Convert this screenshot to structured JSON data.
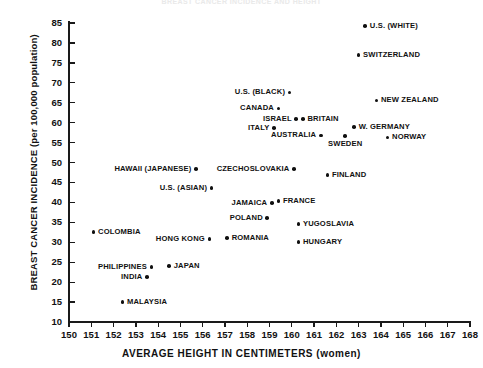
{
  "chart_data": {
    "type": "scatter",
    "title": "BREAST CANCER INCIDENCE AND HEIGHT",
    "xlabel": "AVERAGE HEIGHT IN CENTIMETERS (women)",
    "ylabel": "BREAST CANCER INCIDENCE (per 100,000 population)",
    "xlim": [
      150,
      168
    ],
    "ylim": [
      10,
      85
    ],
    "xticks": [
      150,
      151,
      152,
      153,
      154,
      155,
      156,
      157,
      158,
      159,
      160,
      161,
      162,
      163,
      164,
      165,
      166,
      167,
      168
    ],
    "yticks": [
      10,
      15,
      20,
      25,
      30,
      35,
      40,
      45,
      50,
      55,
      60,
      65,
      70,
      75,
      80,
      85
    ],
    "grid": false,
    "legend": false,
    "marker": "filled-circle",
    "points": [
      {
        "label": "U.S. (WHITE)",
        "x": 163.3,
        "y": 84.2,
        "label_pos": "right"
      },
      {
        "label": "SWITZERLAND",
        "x": 163.0,
        "y": 77.0,
        "label_pos": "right"
      },
      {
        "label": "U.S. (BLACK)",
        "x": 159.9,
        "y": 67.6,
        "label_pos": "left"
      },
      {
        "label": "NEW ZEALAND",
        "x": 163.8,
        "y": 65.6,
        "label_pos": "right"
      },
      {
        "label": "CANADA",
        "x": 159.4,
        "y": 63.6,
        "label_pos": "left"
      },
      {
        "label": "ISRAEL",
        "x": 160.2,
        "y": 60.9,
        "label_pos": "left"
      },
      {
        "label": "BRITAIN",
        "x": 160.5,
        "y": 60.9,
        "label_pos": "right"
      },
      {
        "label": "W. GERMANY",
        "x": 162.8,
        "y": 58.9,
        "label_pos": "right"
      },
      {
        "label": "ITALY",
        "x": 159.2,
        "y": 58.6,
        "label_pos": "left"
      },
      {
        "label": "AUSTRALIA",
        "x": 161.3,
        "y": 56.8,
        "label_pos": "left"
      },
      {
        "label": "SWEDEN",
        "x": 162.4,
        "y": 56.6,
        "label_pos": "below"
      },
      {
        "label": "NORWAY",
        "x": 164.3,
        "y": 56.3,
        "label_pos": "right"
      },
      {
        "label": "HAWAII (JAPANESE)",
        "x": 155.7,
        "y": 48.4,
        "label_pos": "left"
      },
      {
        "label": "CZECHOSLOVAKIA",
        "x": 160.1,
        "y": 48.4,
        "label_pos": "left"
      },
      {
        "label": "FINLAND",
        "x": 161.6,
        "y": 46.9,
        "label_pos": "right"
      },
      {
        "label": "U.S. (ASIAN)",
        "x": 156.4,
        "y": 43.6,
        "label_pos": "left"
      },
      {
        "label": "FRANCE",
        "x": 159.4,
        "y": 40.3,
        "label_pos": "right"
      },
      {
        "label": "JAMAICA",
        "x": 159.1,
        "y": 39.8,
        "label_pos": "left"
      },
      {
        "label": "POLAND",
        "x": 158.9,
        "y": 36.1,
        "label_pos": "left"
      },
      {
        "label": "YUGOSLAVIA",
        "x": 160.3,
        "y": 34.6,
        "label_pos": "right"
      },
      {
        "label": "COLOMBIA",
        "x": 151.1,
        "y": 32.6,
        "label_pos": "right"
      },
      {
        "label": "HONG KONG",
        "x": 156.3,
        "y": 30.8,
        "label_pos": "left"
      },
      {
        "label": "ROMANIA",
        "x": 157.1,
        "y": 31.1,
        "label_pos": "right"
      },
      {
        "label": "HUNGARY",
        "x": 160.3,
        "y": 30.1,
        "label_pos": "right"
      },
      {
        "label": "PHILIPPINES",
        "x": 153.7,
        "y": 23.8,
        "label_pos": "left"
      },
      {
        "label": "JAPAN",
        "x": 154.5,
        "y": 24.0,
        "label_pos": "right"
      },
      {
        "label": "INDIA",
        "x": 153.5,
        "y": 21.3,
        "label_pos": "left"
      },
      {
        "label": "MALAYSIA",
        "x": 152.4,
        "y": 15.0,
        "label_pos": "right"
      }
    ]
  }
}
